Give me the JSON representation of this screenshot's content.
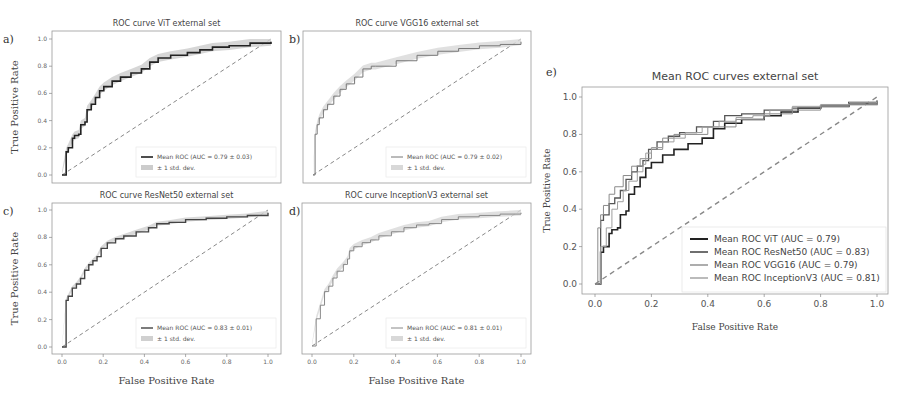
{
  "chart_data": [
    {
      "panel": "a",
      "type": "line",
      "title": "ROC curve ViT external set",
      "xlabel": "",
      "ylabel": "True Positive Rate",
      "xlim": [
        0,
        1
      ],
      "ylim": [
        0,
        1
      ],
      "yticks": [
        "0.0",
        "0.2",
        "0.4",
        "0.6",
        "0.8",
        "1.0"
      ],
      "xticks": [],
      "series": [
        {
          "name": "Mean ROC (AUC = 0.79 ± 0.03)",
          "color": "#222222",
          "width": 1.6,
          "x": [
            0.0,
            0.02,
            0.03,
            0.05,
            0.06,
            0.08,
            0.09,
            0.11,
            0.12,
            0.14,
            0.16,
            0.18,
            0.2,
            0.24,
            0.28,
            0.33,
            0.38,
            0.42,
            0.46,
            0.52,
            0.6,
            0.66,
            0.72,
            0.8,
            0.9,
            1.0
          ],
          "y": [
            0.0,
            0.17,
            0.2,
            0.27,
            0.29,
            0.3,
            0.37,
            0.39,
            0.48,
            0.52,
            0.57,
            0.62,
            0.65,
            0.69,
            0.72,
            0.75,
            0.78,
            0.83,
            0.86,
            0.88,
            0.9,
            0.92,
            0.94,
            0.95,
            0.97,
            0.98
          ]
        },
        {
          "name": "± 1 std. dev.",
          "type": "band",
          "color": "#cccccc",
          "halfwidth": 0.03
        }
      ],
      "chance_line": true,
      "legend": [
        "Mean ROC (AUC = 0.79 ± 0.03)",
        "± 1 std. dev."
      ],
      "legend_position": "lower right"
    },
    {
      "panel": "b",
      "type": "line",
      "title": "ROC curve VGG16 external set",
      "xlabel": "",
      "ylabel": "",
      "xlim": [
        0,
        1
      ],
      "ylim": [
        0,
        1
      ],
      "series": [
        {
          "name": "Mean ROC (AUC = 0.79 ± 0.02)",
          "color": "#777777",
          "width": 1.0,
          "x": [
            0.0,
            0.01,
            0.02,
            0.03,
            0.05,
            0.07,
            0.1,
            0.13,
            0.16,
            0.2,
            0.24,
            0.28,
            0.3,
            0.4,
            0.5,
            0.6,
            0.7,
            0.8,
            0.9,
            1.0
          ],
          "y": [
            0.0,
            0.3,
            0.37,
            0.42,
            0.48,
            0.52,
            0.58,
            0.63,
            0.67,
            0.72,
            0.78,
            0.8,
            0.8,
            0.84,
            0.88,
            0.91,
            0.93,
            0.95,
            0.96,
            0.98
          ]
        },
        {
          "name": "± 1 std. dev.",
          "type": "band",
          "color": "#d8d8d8",
          "halfwidth": 0.025
        }
      ],
      "chance_line": true,
      "legend": [
        "Mean ROC (AUC = 0.79 ± 0.02)",
        "± 1 std. dev."
      ],
      "legend_position": "lower right"
    },
    {
      "panel": "c",
      "type": "line",
      "title": "ROC curve ResNet50 external set",
      "xlabel": "False Positive Rate",
      "ylabel": "True Positive Rate",
      "xlim": [
        0,
        1
      ],
      "ylim": [
        0,
        1
      ],
      "xticks": [
        "0.0",
        "0.2",
        "0.4",
        "0.6",
        "0.8",
        "1.0"
      ],
      "yticks": [
        "0.0",
        "0.2",
        "0.4",
        "0.6",
        "0.8",
        "1.0"
      ],
      "series": [
        {
          "name": "Mean ROC (AUC = 0.83 ± 0.01)",
          "color": "#444444",
          "width": 1.4,
          "x": [
            0.0,
            0.02,
            0.03,
            0.05,
            0.07,
            0.09,
            0.11,
            0.13,
            0.15,
            0.17,
            0.19,
            0.22,
            0.26,
            0.3,
            0.36,
            0.42,
            0.46,
            0.52,
            0.6,
            0.7,
            0.8,
            0.9,
            1.0
          ],
          "y": [
            0.0,
            0.34,
            0.37,
            0.43,
            0.46,
            0.5,
            0.56,
            0.6,
            0.63,
            0.66,
            0.72,
            0.76,
            0.79,
            0.81,
            0.84,
            0.87,
            0.9,
            0.91,
            0.93,
            0.94,
            0.95,
            0.96,
            0.98
          ]
        },
        {
          "name": "± 1 std. dev.",
          "type": "band",
          "color": "#d0d0d0",
          "halfwidth": 0.015
        }
      ],
      "chance_line": true,
      "legend": [
        "Mean ROC (AUC = 0.83 ± 0.01)",
        "± 1 std. dev."
      ],
      "legend_position": "lower right"
    },
    {
      "panel": "d",
      "type": "line",
      "title": "ROC curve InceptionV3 external set",
      "xlabel": "False Positive Rate",
      "ylabel": "",
      "xlim": [
        0,
        1
      ],
      "ylim": [
        0,
        1
      ],
      "xticks": [
        "0.0",
        "0.2",
        "0.4",
        "0.6",
        "0.8",
        "1.0"
      ],
      "series": [
        {
          "name": "Mean ROC (AUC = 0.81 ± 0.01)",
          "color": "#888888",
          "width": 1.0,
          "x": [
            0.0,
            0.02,
            0.04,
            0.06,
            0.08,
            0.1,
            0.12,
            0.15,
            0.17,
            0.18,
            0.2,
            0.24,
            0.28,
            0.32,
            0.38,
            0.44,
            0.5,
            0.56,
            0.62,
            0.7,
            0.8,
            0.9,
            1.0
          ],
          "y": [
            0.0,
            0.2,
            0.3,
            0.4,
            0.44,
            0.5,
            0.55,
            0.6,
            0.64,
            0.7,
            0.73,
            0.76,
            0.78,
            0.81,
            0.84,
            0.87,
            0.89,
            0.9,
            0.93,
            0.95,
            0.96,
            0.97,
            0.98
          ]
        },
        {
          "name": "± 1 std. dev.",
          "type": "band",
          "color": "#d8d8d8",
          "halfwidth": 0.02
        }
      ],
      "chance_line": true,
      "legend": [
        "Mean ROC (AUC = 0.81 ± 0.01)",
        "± 1 std. dev."
      ],
      "legend_position": "lower right"
    },
    {
      "panel": "e",
      "type": "line",
      "title": "Mean ROC curves external set",
      "xlabel": "False Positive Rate",
      "ylabel": "True Positive Rate",
      "xlim": [
        0,
        1
      ],
      "ylim": [
        0,
        1
      ],
      "xticks": [
        "0.0",
        "0.2",
        "0.4",
        "0.6",
        "0.8",
        "1.0"
      ],
      "yticks": [
        "0.0",
        "0.2",
        "0.4",
        "0.6",
        "0.8",
        "1.0"
      ],
      "series": [
        {
          "name": "Mean ROC ViT (AUC = 0.79)",
          "color": "#222222",
          "width": 1.6,
          "x": [
            0.0,
            0.02,
            0.03,
            0.05,
            0.06,
            0.08,
            0.09,
            0.11,
            0.12,
            0.14,
            0.16,
            0.18,
            0.2,
            0.24,
            0.28,
            0.33,
            0.38,
            0.42,
            0.46,
            0.52,
            0.6,
            0.66,
            0.72,
            0.8,
            0.9,
            1.0
          ],
          "y": [
            0.0,
            0.17,
            0.2,
            0.27,
            0.29,
            0.3,
            0.37,
            0.39,
            0.48,
            0.52,
            0.57,
            0.62,
            0.65,
            0.69,
            0.72,
            0.75,
            0.78,
            0.83,
            0.86,
            0.88,
            0.9,
            0.92,
            0.94,
            0.95,
            0.97,
            0.98
          ]
        },
        {
          "name": "Mean ROC ResNet50 (AUC = 0.83)",
          "color": "#555555",
          "width": 1.3,
          "x": [
            0.0,
            0.02,
            0.03,
            0.05,
            0.07,
            0.09,
            0.11,
            0.13,
            0.15,
            0.17,
            0.19,
            0.22,
            0.26,
            0.3,
            0.36,
            0.42,
            0.46,
            0.52,
            0.6,
            0.7,
            0.8,
            0.9,
            1.0
          ],
          "y": [
            0.0,
            0.34,
            0.37,
            0.43,
            0.46,
            0.5,
            0.56,
            0.6,
            0.63,
            0.66,
            0.72,
            0.76,
            0.79,
            0.81,
            0.84,
            0.87,
            0.9,
            0.91,
            0.93,
            0.94,
            0.95,
            0.96,
            0.98
          ]
        },
        {
          "name": "Mean ROC VGG16 (AUC = 0.79)",
          "color": "#8a8a8a",
          "width": 1.0,
          "x": [
            0.0,
            0.01,
            0.02,
            0.03,
            0.05,
            0.07,
            0.1,
            0.13,
            0.16,
            0.2,
            0.24,
            0.28,
            0.3,
            0.4,
            0.5,
            0.6,
            0.7,
            0.8,
            0.9,
            1.0
          ],
          "y": [
            0.0,
            0.3,
            0.37,
            0.42,
            0.48,
            0.52,
            0.58,
            0.63,
            0.67,
            0.72,
            0.78,
            0.8,
            0.8,
            0.84,
            0.88,
            0.91,
            0.93,
            0.95,
            0.96,
            0.98
          ]
        },
        {
          "name": "Mean ROC InceptionV3 (AUC = 0.81)",
          "color": "#9e9e9e",
          "width": 1.0,
          "x": [
            0.0,
            0.02,
            0.04,
            0.06,
            0.08,
            0.1,
            0.12,
            0.15,
            0.17,
            0.18,
            0.2,
            0.24,
            0.28,
            0.32,
            0.38,
            0.44,
            0.5,
            0.56,
            0.62,
            0.7,
            0.8,
            0.9,
            1.0
          ],
          "y": [
            0.0,
            0.2,
            0.3,
            0.4,
            0.44,
            0.5,
            0.55,
            0.6,
            0.64,
            0.7,
            0.73,
            0.76,
            0.78,
            0.81,
            0.84,
            0.87,
            0.89,
            0.9,
            0.93,
            0.95,
            0.96,
            0.97,
            0.98
          ]
        }
      ],
      "chance_line": true,
      "legend": [
        "Mean ROC ViT (AUC = 0.79)",
        "Mean ROC ResNet50 (AUC = 0.83)",
        "Mean ROC VGG16 (AUC = 0.79)",
        "Mean ROC InceptionV3 (AUC = 0.81)"
      ],
      "legend_position": "lower right"
    }
  ],
  "panels": {
    "a": {
      "label": "a)",
      "title": "ROC curve ViT external set",
      "ylabel": "True Positive Rate",
      "legend": [
        "Mean ROC (AUC = 0.79 ± 0.03)",
        "± 1 std. dev."
      ]
    },
    "b": {
      "label": "b)",
      "title": "ROC curve VGG16 external set",
      "legend": [
        "Mean ROC (AUC = 0.79 ± 0.02)",
        "± 1 std. dev."
      ]
    },
    "c": {
      "label": "c)",
      "title": "ROC curve ResNet50 external set",
      "ylabel": "True Positive Rate",
      "legend": [
        "Mean ROC (AUC = 0.83 ± 0.01)",
        "± 1 std. dev."
      ]
    },
    "d": {
      "label": "d)",
      "title": "ROC curve InceptionV3 external set",
      "legend": [
        "Mean ROC (AUC = 0.81 ± 0.01)",
        "± 1 std. dev."
      ]
    },
    "e": {
      "label": "e)",
      "title": "Mean ROC curves external set",
      "ylabel": "True Positive Rate",
      "xlabel": "False Positive Rate"
    },
    "shared_xlabel": "False Positive Rate"
  },
  "ticks": [
    "0.0",
    "0.2",
    "0.4",
    "0.6",
    "0.8",
    "1.0"
  ]
}
